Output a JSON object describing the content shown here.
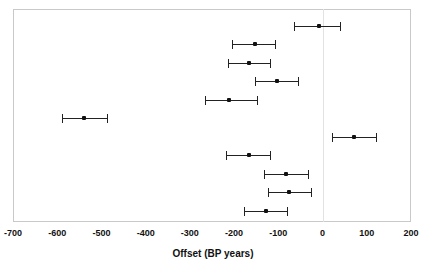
{
  "chart_data": {
    "type": "scatter",
    "orientation": "horizontal",
    "title": "",
    "subtitle": "",
    "xlabel": "Offset (BP years)",
    "ylabel": "",
    "xlim": [
      -700,
      200
    ],
    "ylim": [
      0,
      12
    ],
    "grid": false,
    "legend": null,
    "xticks": [
      -700,
      -600,
      -500,
      -400,
      -300,
      -200,
      -100,
      0,
      100,
      200
    ],
    "xtick_labels": [
      "-700",
      "-600",
      "-500",
      "-400",
      "-300",
      "-200",
      "-100",
      "0",
      "100",
      "200"
    ],
    "yticks": [],
    "ytick_labels": [],
    "reference_lines": [
      {
        "axis": "x",
        "value": 0,
        "color": "#e2e2e2"
      }
    ],
    "marker_color": "#111111",
    "error_color": "#222222",
    "series": [
      {
        "name": "Offset estimates",
        "points": [
          {
            "index": 1,
            "value": -8,
            "low": -64,
            "high": 39
          },
          {
            "index": 2,
            "value": -153,
            "low": -205,
            "high": -108
          },
          {
            "index": 3,
            "value": -166,
            "low": -214,
            "high": -119
          },
          {
            "index": 4,
            "value": -103,
            "low": -153,
            "high": -55
          },
          {
            "index": 5,
            "value": -212,
            "low": -266,
            "high": -149
          },
          {
            "index": 6,
            "value": -539,
            "low": -589,
            "high": -487
          },
          {
            "index": 7,
            "value": 71,
            "low": 21,
            "high": 121
          },
          {
            "index": 8,
            "value": -166,
            "low": -219,
            "high": -119
          },
          {
            "index": 9,
            "value": -83,
            "low": -133,
            "high": -33
          },
          {
            "index": 10,
            "value": -76,
            "low": -124,
            "high": -26
          },
          {
            "index": 11,
            "value": -129,
            "low": -177,
            "high": -80
          }
        ]
      }
    ]
  },
  "axis": {
    "x_title": "Offset (BP years)"
  }
}
